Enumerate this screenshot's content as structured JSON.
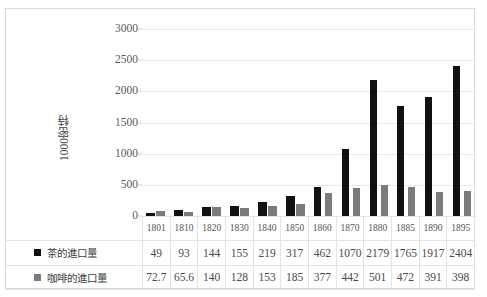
{
  "chart_data": {
    "type": "bar",
    "title": "",
    "xlabel": "",
    "ylabel": "1000密特",
    "ylim": [
      0,
      3000
    ],
    "yticks": [
      3000,
      2500,
      2000,
      1500,
      1000,
      500,
      0
    ],
    "grid": true,
    "legend_position": "data-table-left",
    "categories": [
      "1801",
      "1810",
      "1820",
      "1830",
      "1840",
      "1850",
      "1860",
      "1870",
      "1880",
      "1885",
      "1890",
      "1895"
    ],
    "series": [
      {
        "name": "茶的進口量",
        "color": "#111111",
        "values": [
          49,
          93,
          144,
          155,
          219,
          317,
          462,
          1070,
          2179,
          1765,
          1917,
          2404
        ],
        "value_labels": [
          "49",
          "93",
          "144",
          "155",
          "219",
          "317",
          "462",
          "1070",
          "2179",
          "1765",
          "1917",
          "2404"
        ]
      },
      {
        "name": "咖啡的進口量",
        "color": "#7b7b7b",
        "values": [
          72.7,
          65.6,
          140,
          128,
          153,
          185,
          377,
          442,
          501,
          472,
          391,
          398
        ],
        "value_labels": [
          "72.7",
          "65.6",
          "140",
          "128",
          "153",
          "185",
          "377",
          "442",
          "501",
          "472",
          "391",
          "398"
        ]
      }
    ]
  }
}
